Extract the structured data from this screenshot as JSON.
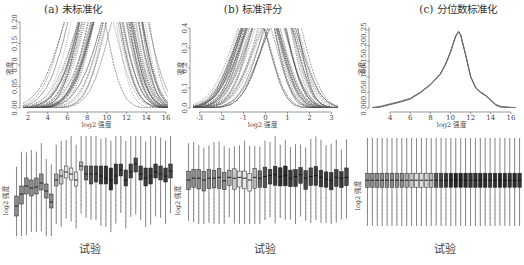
{
  "chart_data": [
    {
      "panel": "a-top",
      "type": "line",
      "title": "(a) 未标准化",
      "xlabel": "log2 强度",
      "ylabel": "密度",
      "xticks": [
        2,
        4,
        6,
        8,
        10,
        12,
        14,
        16
      ],
      "yticks": [
        "0.00",
        "0.05",
        "0.10",
        "0.15",
        "0.20"
      ],
      "xlim": [
        1.5,
        16.2
      ],
      "ylim": [
        0,
        0.2
      ],
      "grid": false,
      "description": "Overlaid density curves (~30 arrays), peaks clipped at 0.20, modes spread between ~8 and ~13",
      "series_modes": [
        8.5,
        9.0,
        9.2,
        9.5,
        9.8,
        10.0,
        10.2,
        10.4,
        10.6,
        10.8,
        11.0,
        11.2,
        11.4,
        11.6,
        11.8,
        12.0,
        12.3,
        12.6
      ]
    },
    {
      "panel": "b-top",
      "type": "line",
      "title": "(b) 标准评分",
      "xlabel": "log2 强度",
      "ylabel": "密度",
      "xticks": [
        -3,
        -2,
        -1,
        0,
        1,
        2,
        3
      ],
      "yticks": [
        "0.0",
        "0.1",
        "0.2",
        "0.3",
        "0.4"
      ],
      "xlim": [
        -3.3,
        3.3
      ],
      "ylim": [
        0,
        0.4
      ],
      "grid": false,
      "description": "Overlaid z-score density curves, peaks clipped at 0.4, centered near 0",
      "series_modes": [
        -0.3,
        -0.2,
        -0.1,
        0.0,
        0.1,
        0.2,
        0.6,
        0.7,
        0.8
      ]
    },
    {
      "panel": "c-top",
      "type": "line",
      "title": "(c) 分位数标准化",
      "xlabel": "log2 强度",
      "ylabel": "密度",
      "xticks": [
        4,
        6,
        8,
        10,
        12,
        14,
        16
      ],
      "yticks": [
        "0.00",
        "0.05",
        "0.10",
        "0.15",
        "0.20",
        "0.25"
      ],
      "xlim": [
        2.2,
        16.5
      ],
      "ylim": [
        0,
        0.26
      ],
      "grid": false,
      "description": "All density curves coincide after quantile normalization; single peak ~0.245 at ~10.8",
      "x": [
        2.2,
        3,
        4,
        5,
        6,
        7,
        8,
        9,
        9.5,
        10,
        10.5,
        10.8,
        11,
        11.5,
        12,
        12.5,
        13,
        13.5,
        14,
        14.5,
        15,
        16,
        16.5
      ],
      "y": [
        0.0,
        0.004,
        0.012,
        0.02,
        0.03,
        0.05,
        0.075,
        0.11,
        0.14,
        0.18,
        0.23,
        0.245,
        0.235,
        0.17,
        0.1,
        0.065,
        0.05,
        0.04,
        0.025,
        0.01,
        0.004,
        0.001,
        0.0
      ]
    },
    {
      "panel": "a-bottom",
      "type": "box",
      "xlabel": "试验",
      "ylabel": "log2 强度",
      "n_arrays": 32,
      "medians": [
        0.3,
        0.42,
        0.5,
        0.48,
        0.49,
        0.53,
        0.45,
        0.34,
        0.56,
        0.6,
        0.64,
        0.62,
        0.56,
        0.7,
        0.62,
        0.62,
        0.62,
        0.6,
        0.58,
        0.56,
        0.6,
        0.66,
        0.56,
        0.64,
        0.72,
        0.62,
        0.58,
        0.6,
        0.64,
        0.62,
        0.6,
        0.65
      ],
      "q1": [
        0.2,
        0.32,
        0.42,
        0.4,
        0.42,
        0.46,
        0.38,
        0.28,
        0.5,
        0.52,
        0.58,
        0.56,
        0.5,
        0.66,
        0.56,
        0.52,
        0.54,
        0.52,
        0.52,
        0.46,
        0.52,
        0.6,
        0.5,
        0.58,
        0.64,
        0.56,
        0.5,
        0.52,
        0.58,
        0.56,
        0.54,
        0.58
      ],
      "q3": [
        0.4,
        0.5,
        0.58,
        0.56,
        0.58,
        0.62,
        0.52,
        0.42,
        0.62,
        0.66,
        0.7,
        0.68,
        0.64,
        0.74,
        0.7,
        0.7,
        0.7,
        0.7,
        0.7,
        0.68,
        0.72,
        0.72,
        0.66,
        0.72,
        0.78,
        0.7,
        0.68,
        0.68,
        0.72,
        0.7,
        0.68,
        0.72
      ],
      "fills": [
        "#8c8c8c",
        "#8c8c8c",
        "#8c8c8c",
        "#8c8c8c",
        "#8c8c8c",
        "#8c8c8c",
        "#8c8c8c",
        "#8c8c8c",
        "#a8a8a8",
        "#c8c8c8",
        "#e8e8e8",
        "#e8e8e8",
        "#e8e8e8",
        "#b8b8b8",
        "#666666",
        "#555555",
        "#444444",
        "#3a3a3a",
        "#303030",
        "#2a2a2a",
        "#383838",
        "#3c3c3c",
        "#404040",
        "#444444",
        "#484848",
        "#404040",
        "#3a3a3a",
        "#333333",
        "#3a3a3a",
        "#444444",
        "#3a3a3a",
        "#484848"
      ]
    },
    {
      "panel": "b-bottom",
      "type": "box",
      "xlabel": "试验",
      "ylabel": "log2 强度",
      "n_arrays": 32,
      "description": "Z-score normalized boxplots — medians nearly aligned",
      "medians": [
        0.5,
        0.52,
        0.52,
        0.5,
        0.52,
        0.52,
        0.53,
        0.49,
        0.53,
        0.52,
        0.53,
        0.52,
        0.5,
        0.53,
        0.52,
        0.54,
        0.55,
        0.56,
        0.54,
        0.55,
        0.52,
        0.54,
        0.56,
        0.52,
        0.54,
        0.55,
        0.53,
        0.51,
        0.5,
        0.53,
        0.52,
        0.53
      ],
      "fills": [
        "#8c8c8c",
        "#8c8c8c",
        "#8c8c8c",
        "#8c8c8c",
        "#8c8c8c",
        "#8c8c8c",
        "#8c8c8c",
        "#8c8c8c",
        "#a8a8a8",
        "#c8c8c8",
        "#e8e8e8",
        "#e8e8e8",
        "#e8e8e8",
        "#b8b8b8",
        "#666666",
        "#555555",
        "#444444",
        "#3a3a3a",
        "#303030",
        "#2a2a2a",
        "#383838",
        "#3c3c3c",
        "#404040",
        "#444444",
        "#484848",
        "#404040",
        "#3a3a3a",
        "#333333",
        "#3a3a3a",
        "#444444",
        "#3a3a3a",
        "#484848"
      ]
    },
    {
      "panel": "c-bottom",
      "type": "box",
      "xlabel": "试验",
      "ylabel": "log2 强度",
      "n_arrays": 32,
      "description": "Quantile normalized boxplots — identical distributions",
      "fills": [
        "#8c8c8c",
        "#8c8c8c",
        "#8c8c8c",
        "#8c8c8c",
        "#8c8c8c",
        "#8c8c8c",
        "#8c8c8c",
        "#8c8c8c",
        "#a8a8a8",
        "#c8c8c8",
        "#e0e0e0",
        "#e0e0e0",
        "#d8d8d8",
        "#b8b8b8",
        "#555555",
        "#444444",
        "#333333",
        "#2a2a2a",
        "#222222",
        "#222222",
        "#2a2a2a",
        "#333333",
        "#333333",
        "#2a2a2a",
        "#2a2a2a",
        "#333333",
        "#2a2a2a",
        "#222222",
        "#2a2a2a",
        "#333333",
        "#2a2a2a",
        "#333333"
      ]
    }
  ],
  "panels": {
    "a": {
      "title": "(a) 未标准化",
      "ylabel": "密度",
      "xlabel": "log2 强度",
      "box_ylabel": "log2 强度",
      "box_xlabel": "试验"
    },
    "b": {
      "title": "(b) 标准评分",
      "ylabel": "密度",
      "xlabel": "log2 强度",
      "box_ylabel": "log2 强度",
      "box_xlabel": "试验"
    },
    "c": {
      "title": "(c) 分位数标准化",
      "ylabel": "密度",
      "xlabel": "log2 强度",
      "box_ylabel": "log2 强度",
      "box_xlabel": "试验"
    }
  }
}
